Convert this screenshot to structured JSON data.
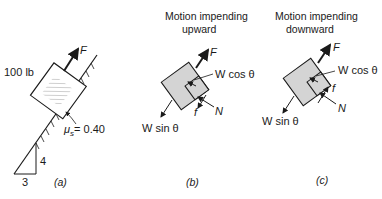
{
  "panel_a": {
    "weight_label": "100 lb",
    "force_label": "F",
    "friction_label": "μs = 0.40",
    "mu": "μ",
    "mu_sub": "s",
    "mu_value": "= 0.40",
    "slope_rise": "4",
    "slope_run": "3",
    "caption": "(a)"
  },
  "panel_b": {
    "title_line1": "Motion impending",
    "title_line2": "upward",
    "force_label": "F",
    "normal_component": "W cos θ",
    "normal_force": "N",
    "friction": "f",
    "parallel_component": "W sin θ",
    "caption": "(b)"
  },
  "panel_c": {
    "title_line1": "Motion impending",
    "title_line2": "downward",
    "force_label": "F",
    "normal_component": "W cos θ",
    "normal_force": "N",
    "friction": "f",
    "parallel_component": "W sin θ",
    "caption": "(c)"
  }
}
